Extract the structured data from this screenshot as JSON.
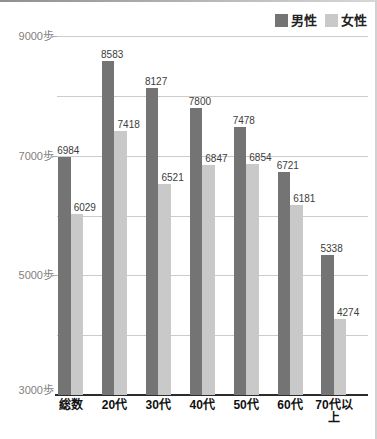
{
  "chart_data": {
    "type": "bar",
    "title": "",
    "categories": [
      "総数",
      "20代",
      "30代",
      "40代",
      "50代",
      "60代",
      "70代以上"
    ],
    "series": [
      {
        "name": "男性",
        "color": "#747474",
        "values": [
          6984,
          8583,
          8127,
          7800,
          7478,
          6721,
          5338
        ]
      },
      {
        "name": "女性",
        "color": "#c9c9c9",
        "values": [
          6029,
          7418,
          6521,
          6847,
          6854,
          6181,
          4274
        ]
      }
    ],
    "ylabel": "歩",
    "ylim": [
      3000,
      9000
    ],
    "gridline_step": 1000,
    "grid": true,
    "labeled_ticks": [
      {
        "value": 9000,
        "label": "9000歩"
      },
      {
        "value": 7000,
        "label": "7000歩"
      },
      {
        "value": 5000,
        "label": "5000歩"
      },
      {
        "value": 3000,
        "label": "3000歩"
      }
    ],
    "legend_position": "top-right",
    "value_labels_shown": true
  },
  "legend": {
    "items": [
      {
        "label": "男性",
        "color": "#747474"
      },
      {
        "label": "女性",
        "color": "#c9c9c9"
      }
    ]
  }
}
